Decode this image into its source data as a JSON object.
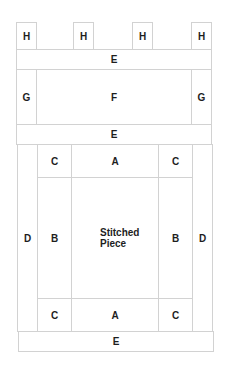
{
  "diagram": {
    "title": "",
    "colors": {
      "line": "#d2d2d2",
      "text": "#1e1e1e",
      "background": "#ffffff"
    },
    "pieces": [
      {
        "id": "h1",
        "label": "H"
      },
      {
        "id": "h2",
        "label": "H"
      },
      {
        "id": "h3",
        "label": "H"
      },
      {
        "id": "h4",
        "label": "H"
      },
      {
        "id": "e_top",
        "label": "E"
      },
      {
        "id": "g_left",
        "label": "G"
      },
      {
        "id": "f",
        "label": "F"
      },
      {
        "id": "g_right",
        "label": "G"
      },
      {
        "id": "e_mid",
        "label": "E"
      },
      {
        "id": "d_left",
        "label": "D"
      },
      {
        "id": "c_tl",
        "label": "C"
      },
      {
        "id": "a_top",
        "label": "A"
      },
      {
        "id": "c_tr",
        "label": "C"
      },
      {
        "id": "d_right",
        "label": "D"
      },
      {
        "id": "b_left",
        "label": "B"
      },
      {
        "id": "stitched",
        "label_line1": "Stitched",
        "label_line2": "Piece"
      },
      {
        "id": "b_right",
        "label": "B"
      },
      {
        "id": "c_bl",
        "label": "C"
      },
      {
        "id": "a_bottom",
        "label": "A"
      },
      {
        "id": "c_br",
        "label": "C"
      },
      {
        "id": "e_bottom",
        "label": "E"
      }
    ]
  }
}
